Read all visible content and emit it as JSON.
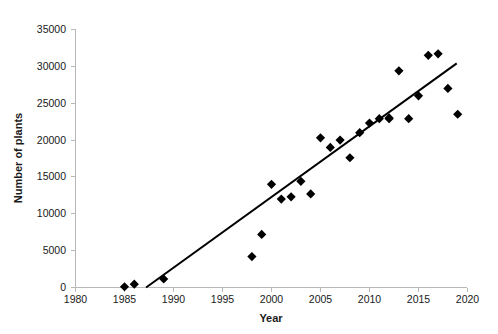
{
  "chart_data": {
    "type": "scatter",
    "title": "",
    "xlabel": "Year",
    "ylabel": "Number of plants",
    "xlim": [
      1980,
      2020
    ],
    "ylim": [
      0,
      35000
    ],
    "xticks": [
      1980,
      1985,
      1990,
      1995,
      2000,
      2005,
      2010,
      2015,
      2020
    ],
    "yticks": [
      0,
      5000,
      10000,
      15000,
      20000,
      25000,
      30000,
      35000
    ],
    "xtick_labels": [
      "1980",
      "1985",
      "1990",
      "1995",
      "2000",
      "2005",
      "2010",
      "2015",
      "2020"
    ],
    "ytick_labels": [
      "0",
      "5000",
      "10000",
      "15000",
      "20000",
      "25000",
      "30000",
      "35000"
    ],
    "grid": false,
    "legend": null,
    "marker": "diamond",
    "marker_color": "#000000",
    "points": [
      {
        "x": 1985,
        "y": 100
      },
      {
        "x": 1986,
        "y": 450
      },
      {
        "x": 1989,
        "y": 1150
      },
      {
        "x": 1998,
        "y": 4200
      },
      {
        "x": 1999,
        "y": 7200
      },
      {
        "x": 2000,
        "y": 14000
      },
      {
        "x": 2001,
        "y": 12000
      },
      {
        "x": 2002,
        "y": 12300
      },
      {
        "x": 2003,
        "y": 14400
      },
      {
        "x": 2004,
        "y": 12700
      },
      {
        "x": 2005,
        "y": 20300
      },
      {
        "x": 2006,
        "y": 19000
      },
      {
        "x": 2007,
        "y": 20000
      },
      {
        "x": 2008,
        "y": 17600
      },
      {
        "x": 2009,
        "y": 21000
      },
      {
        "x": 2010,
        "y": 22300
      },
      {
        "x": 2011,
        "y": 22900
      },
      {
        "x": 2012,
        "y": 22900
      },
      {
        "x": 2012,
        "y": 23000
      },
      {
        "x": 2013,
        "y": 29400
      },
      {
        "x": 2014,
        "y": 22900
      },
      {
        "x": 2015,
        "y": 26000
      },
      {
        "x": 2016,
        "y": 31500
      },
      {
        "x": 2017,
        "y": 31700
      },
      {
        "x": 2018,
        "y": 27000
      },
      {
        "x": 2019,
        "y": 23500
      }
    ],
    "trendline": {
      "type": "linear",
      "x_start": 1987.2,
      "y_start": 0,
      "x_end": 2018.9,
      "y_end": 30400
    }
  }
}
